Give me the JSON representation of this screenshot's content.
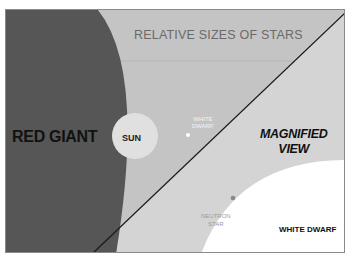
{
  "diagram": {
    "title": "RELATIVE SIZES OF STARS",
    "colors": {
      "background": "#c9c9c9",
      "red_giant": "#555555",
      "sun": "#e2e2e2",
      "white_dwarf": "#ffffff",
      "magnified_region": "#d6d6d6",
      "divider_line": "#1a1a1a",
      "neutron_star": "#888888"
    },
    "labels": {
      "red_giant": "RED GIANT",
      "sun": "SUN",
      "white_dwarf_small_line1": "WHITE",
      "white_dwarf_small_line2": "DWARF",
      "magnified_line1": "MAGNIFIED",
      "magnified_line2": "VIEW",
      "neutron_star_line1": "NEUTRON",
      "neutron_star_line2": "STAR",
      "white_dwarf_large": "WHITE DWARF"
    }
  }
}
